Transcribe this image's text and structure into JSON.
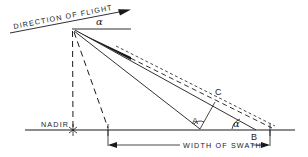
{
  "figure": {
    "kind": "line-diagram",
    "title_text_visible": false,
    "background_color": "#ffffff",
    "ink_color": "#1a1a1a"
  },
  "labels": {
    "direction_of_flight": "DIRECTION OF FLIGHT",
    "nadir": "NADIR",
    "width_of_swath": "WIDTH OF SWATH",
    "point_a": "A",
    "point_b": "B",
    "point_c": "C",
    "angle_alpha_top": "α",
    "angle_alpha_bottom": "α"
  },
  "geometry": {
    "apex": {
      "x": 72,
      "y": 29
    },
    "nadir_point": {
      "x": 73,
      "y": 130
    },
    "ground_line": {
      "x1": 25,
      "y1": 130,
      "x2": 295,
      "y2": 130
    },
    "flight_line": {
      "x1": 10,
      "y1": 33,
      "x2": 128,
      "y2": 10
    },
    "horizon_line": {
      "x1": 72,
      "y1": 29,
      "x2": 131,
      "y2": 29
    },
    "swath_left": {
      "x": 108,
      "y": 130
    },
    "swath_right": {
      "x": 270,
      "y": 130
    },
    "point_a_ground": {
      "x": 200,
      "y": 130
    },
    "point_b_ground": {
      "x": 255,
      "y": 130
    },
    "dimension_line_y": 145
  },
  "annotations": {
    "icons": [
      "arrowhead-flight-icon",
      "arrowhead-swath-left-icon",
      "arrowhead-swath-right-icon",
      "nadir-cross-icon"
    ]
  }
}
